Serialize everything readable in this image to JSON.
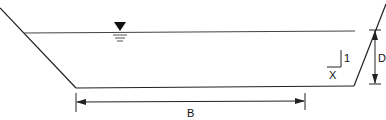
{
  "diagram": {
    "labels": {
      "bottom_width": "B",
      "depth": "D",
      "slope_vertical": "1",
      "slope_horizontal": "X"
    },
    "symbols": {
      "water_surface": "water-surface-triangle-icon"
    },
    "colors": {
      "line": "#222222",
      "water_line": "#444444",
      "background": "#ffffff"
    }
  }
}
